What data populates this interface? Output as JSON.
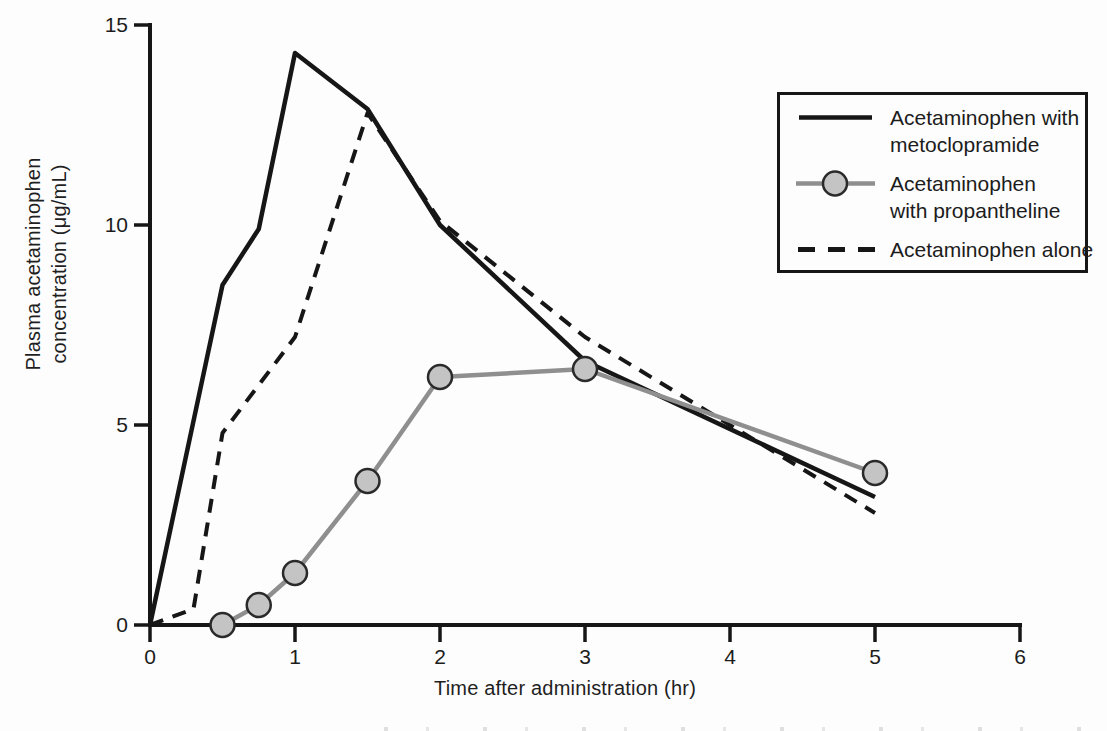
{
  "figure": {
    "background": "#fdfdfd",
    "axis_color": "#161616",
    "tick_label_color": "#1c1c1c"
  },
  "chart_data": {
    "type": "line",
    "title": "",
    "xlabel": "Time after administration (hr)",
    "ylabel_line1": "Plasma acetaminophen",
    "ylabel_line2": "concentration (μg/mL)",
    "xlim": [
      0,
      6
    ],
    "ylim": [
      0,
      15
    ],
    "x_ticks": [
      0,
      1,
      2,
      3,
      4,
      5,
      6
    ],
    "y_ticks": [
      0,
      5,
      10,
      15
    ],
    "grid": false,
    "legend_position": "upper right",
    "series": [
      {
        "name": "Acetaminophen with metoclopramide",
        "legend_label_lines": [
          "Acetaminophen with",
          "metoclopramide"
        ],
        "line_style": "solid",
        "color": "#161616",
        "marker": "none",
        "points": [
          [
            0,
            0
          ],
          [
            0.5,
            8.5
          ],
          [
            0.75,
            9.9
          ],
          [
            1,
            14.3
          ],
          [
            1.5,
            12.9
          ],
          [
            2,
            10.0
          ],
          [
            3,
            6.6
          ],
          [
            5,
            3.2
          ]
        ]
      },
      {
        "name": "Acetaminophen with propantheline",
        "legend_label_lines": [
          "Acetaminophen",
          "with propantheline"
        ],
        "line_style": "solid",
        "color": "#8f8f8f",
        "marker": "circle",
        "marker_fill": "#c4c4c4",
        "marker_stroke": "#2a2a2a",
        "points": [
          [
            0.5,
            0
          ],
          [
            0.75,
            0.5
          ],
          [
            1,
            1.3
          ],
          [
            1.5,
            3.6
          ],
          [
            2,
            6.2
          ],
          [
            3,
            6.4
          ],
          [
            5,
            3.8
          ]
        ]
      },
      {
        "name": "Acetaminophen alone",
        "legend_label_lines": [
          "Acetaminophen alone"
        ],
        "line_style": "dashed",
        "color": "#161616",
        "marker": "none",
        "points": [
          [
            0,
            0
          ],
          [
            0.3,
            0.4
          ],
          [
            0.5,
            4.8
          ],
          [
            1,
            7.2
          ],
          [
            1.5,
            12.8
          ],
          [
            2,
            10.1
          ],
          [
            3,
            7.2
          ],
          [
            5,
            2.8
          ]
        ]
      }
    ]
  }
}
